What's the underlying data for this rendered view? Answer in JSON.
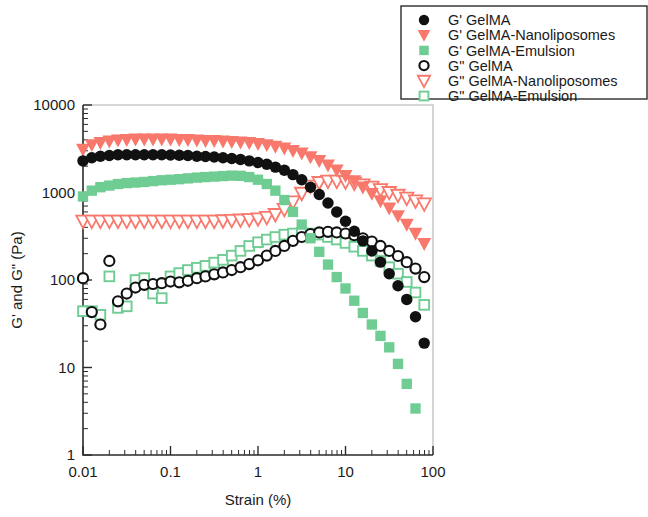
{
  "chart_data": {
    "type": "scatter",
    "title": "",
    "xlabel": "Strain (%)",
    "ylabel": "G' and G\" (Pa)",
    "xscale": "log",
    "yscale": "log",
    "xlim": [
      0.01,
      100
    ],
    "ylim": [
      1,
      10000
    ],
    "xticks": [
      "0.01",
      "0.1",
      "1",
      "10",
      "100"
    ],
    "xtick_values": [
      0.01,
      0.1,
      1,
      10,
      100
    ],
    "yticks": [
      "1",
      "10",
      "100",
      "1000",
      "10000"
    ],
    "ytick_values": [
      1,
      10,
      100,
      1000,
      10000
    ],
    "grid": false,
    "legend_position": "top-right outside",
    "colors": {
      "black": "#111111",
      "salmon": "#F8786C",
      "green": "#6FCC92"
    },
    "series": [
      {
        "name": "G' GelMA",
        "legend_label": "G' GelMA",
        "color": "#111111",
        "marker": "filled-circle",
        "x": [
          0.01,
          0.0126,
          0.0158,
          0.02,
          0.0251,
          0.0316,
          0.0398,
          0.0501,
          0.0631,
          0.0794,
          0.1,
          0.126,
          0.158,
          0.2,
          0.251,
          0.316,
          0.398,
          0.501,
          0.631,
          0.794,
          1.0,
          1.26,
          1.58,
          2.0,
          2.51,
          3.16,
          3.98,
          5.01,
          6.31,
          7.94,
          10.0,
          12.6,
          15.8,
          20.0,
          25.1,
          31.6,
          39.8,
          50.1,
          63.1,
          79.4
        ],
        "y": [
          2300,
          2500,
          2600,
          2650,
          2700,
          2700,
          2700,
          2700,
          2700,
          2700,
          2680,
          2660,
          2650,
          2600,
          2580,
          2550,
          2500,
          2450,
          2380,
          2300,
          2200,
          2100,
          1950,
          1800,
          1600,
          1400,
          1150,
          950,
          760,
          600,
          470,
          360,
          280,
          215,
          160,
          118,
          86,
          60,
          38,
          19
        ]
      },
      {
        "name": "G' GelMA-Nanoliposomes",
        "legend_label": "G' GelMA-Nanoliposomes",
        "color": "#F8786C",
        "marker": "filled-triangle-down",
        "x": [
          0.01,
          0.0126,
          0.0158,
          0.02,
          0.0251,
          0.0316,
          0.0398,
          0.0501,
          0.0631,
          0.0794,
          0.1,
          0.126,
          0.158,
          0.2,
          0.251,
          0.316,
          0.398,
          0.501,
          0.631,
          0.794,
          1.0,
          1.26,
          1.58,
          2.0,
          2.51,
          3.16,
          3.98,
          5.01,
          6.31,
          7.94,
          10.0,
          12.6,
          15.8,
          20.0,
          25.1,
          31.6,
          39.8,
          50.1,
          63.1,
          79.4
        ],
        "y": [
          3100,
          3500,
          3700,
          3850,
          3950,
          4000,
          4050,
          4050,
          4050,
          4050,
          4050,
          4000,
          4000,
          3950,
          3900,
          3900,
          3850,
          3800,
          3750,
          3700,
          3600,
          3500,
          3350,
          3200,
          3000,
          2800,
          2550,
          2300,
          2050,
          1800,
          1550,
          1350,
          1150,
          970,
          800,
          660,
          540,
          430,
          340,
          260
        ]
      },
      {
        "name": "G' GelMA-Emulsion",
        "legend_label": "G' GelMA-Emulsion",
        "color": "#6FCC92",
        "marker": "filled-square",
        "x": [
          0.01,
          0.0126,
          0.0158,
          0.02,
          0.0251,
          0.0316,
          0.0398,
          0.0501,
          0.0631,
          0.0794,
          0.1,
          0.126,
          0.158,
          0.2,
          0.251,
          0.316,
          0.398,
          0.501,
          0.631,
          0.794,
          1.0,
          1.26,
          1.58,
          2.0,
          2.51,
          3.16,
          3.98,
          5.01,
          6.31,
          7.94,
          10.0,
          12.6,
          15.8,
          20.0,
          25.1,
          31.6,
          39.8,
          50.1,
          63.1,
          79.4
        ],
        "y": [
          900,
          1050,
          1150,
          1200,
          1250,
          1280,
          1300,
          1320,
          1350,
          1380,
          1400,
          1420,
          1450,
          1480,
          1500,
          1520,
          1540,
          1560,
          1550,
          1500,
          1400,
          1250,
          1050,
          820,
          600,
          430,
          300,
          210,
          150,
          108,
          80,
          58,
          42,
          31,
          23,
          17,
          11,
          6.5,
          3.4,
          0.95
        ]
      },
      {
        "name": "G\" GelMA",
        "legend_label": "G\" GelMA",
        "color": "#111111",
        "marker": "open-circle",
        "x": [
          0.01,
          0.0126,
          0.0158,
          0.02,
          0.0251,
          0.0316,
          0.0398,
          0.0501,
          0.0631,
          0.0794,
          0.1,
          0.126,
          0.158,
          0.2,
          0.251,
          0.316,
          0.398,
          0.501,
          0.631,
          0.794,
          1.0,
          1.26,
          1.58,
          2.0,
          2.51,
          3.16,
          3.98,
          5.01,
          6.31,
          7.94,
          10.0,
          12.6,
          15.8,
          20.0,
          25.1,
          31.6,
          39.8,
          50.1,
          63.1,
          79.4
        ],
        "y": [
          105,
          43,
          31,
          165,
          57,
          70,
          82,
          88,
          90,
          92,
          96,
          94,
          98,
          105,
          110,
          116,
          122,
          130,
          140,
          152,
          168,
          190,
          215,
          245,
          280,
          310,
          335,
          350,
          355,
          350,
          340,
          325,
          300,
          275,
          245,
          215,
          188,
          160,
          135,
          108
        ]
      },
      {
        "name": "G\" GelMA-Nanoliposomes",
        "legend_label": "G\" GelMA-Nanoliposomes",
        "color": "#F8786C",
        "marker": "open-triangle-down",
        "x": [
          0.01,
          0.0126,
          0.0158,
          0.02,
          0.0251,
          0.0316,
          0.0398,
          0.0501,
          0.0631,
          0.0794,
          0.1,
          0.126,
          0.158,
          0.2,
          0.251,
          0.316,
          0.398,
          0.501,
          0.631,
          0.794,
          1.0,
          1.26,
          1.58,
          2.0,
          2.51,
          3.16,
          3.98,
          5.01,
          6.31,
          7.94,
          10.0,
          12.6,
          15.8,
          20.0,
          25.1,
          31.6,
          39.8,
          50.1,
          63.1,
          79.4
        ],
        "y": [
          470,
          470,
          470,
          470,
          470,
          470,
          470,
          470,
          470,
          470,
          470,
          470,
          470,
          470,
          470,
          470,
          475,
          480,
          485,
          490,
          500,
          520,
          560,
          640,
          780,
          980,
          1180,
          1300,
          1350,
          1350,
          1320,
          1280,
          1220,
          1150,
          1080,
          1000,
          930,
          860,
          800,
          740
        ]
      },
      {
        "name": "G\" GelMA-Emulsion",
        "legend_label": "G\" GelMA-Emulsion",
        "color": "#6FCC92",
        "marker": "open-square",
        "x": [
          0.01,
          0.0126,
          0.0158,
          0.02,
          0.0251,
          0.0316,
          0.0398,
          0.0501,
          0.0631,
          0.0794,
          0.1,
          0.126,
          0.158,
          0.2,
          0.251,
          0.316,
          0.398,
          0.501,
          0.631,
          0.794,
          1.0,
          1.26,
          1.58,
          2.0,
          2.51,
          3.16,
          3.98,
          5.01,
          6.31,
          7.94,
          10.0,
          12.6,
          15.8,
          20.0,
          25.1,
          31.6,
          39.8,
          50.1,
          63.1,
          79.4
        ],
        "y": [
          44,
          44,
          40,
          110,
          48,
          50,
          100,
          105,
          70,
          62,
          110,
          120,
          130,
          138,
          145,
          158,
          170,
          190,
          215,
          245,
          270,
          290,
          310,
          330,
          340,
          345,
          340,
          330,
          310,
          290,
          265,
          240,
          215,
          190,
          165,
          140,
          118,
          95,
          72,
          52
        ]
      }
    ]
  },
  "legend": {
    "entries": [
      {
        "label": "G' GelMA",
        "marker": "filled-circle",
        "color": "#111111"
      },
      {
        "label": "G' GelMA-Nanoliposomes",
        "marker": "filled-triangle-down",
        "color": "#F8786C"
      },
      {
        "label": "G' GelMA-Emulsion",
        "marker": "filled-square",
        "color": "#6FCC92"
      },
      {
        "label": "G\" GelMA",
        "marker": "open-circle",
        "color": "#111111"
      },
      {
        "label": "G\" GelMA-Nanoliposomes",
        "marker": "open-triangle-down",
        "color": "#F8786C"
      },
      {
        "label": "G\" GelMA-Emulsion",
        "marker": "open-square",
        "color": "#6FCC92"
      }
    ]
  }
}
